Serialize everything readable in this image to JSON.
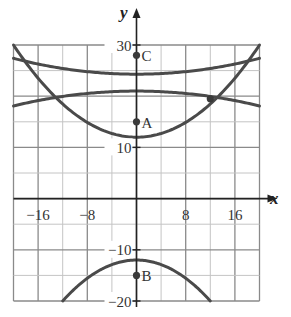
{
  "chart_data": {
    "type": "line",
    "title": "",
    "xlabel": "x",
    "ylabel": "y",
    "xlim": [
      -20,
      20
    ],
    "ylim": [
      -20,
      30
    ],
    "grid": true,
    "x_grid_step": 4,
    "y_grid_step": 5,
    "x_ticks": [
      {
        "value": -16,
        "label": "−16"
      },
      {
        "value": -8,
        "label": "−8"
      },
      {
        "value": 8,
        "label": "8"
      },
      {
        "value": 16,
        "label": "16"
      }
    ],
    "y_ticks": [
      {
        "value": 30,
        "label": "30"
      },
      {
        "value": 10,
        "label": "10"
      },
      {
        "value": -10,
        "label": "−10"
      },
      {
        "value": -20,
        "label": "−20"
      }
    ],
    "series": [
      {
        "name": "upward-parabola",
        "formula": "y = 12 + 0.045x^2",
        "x": [
          -20,
          -16,
          -12,
          -8,
          -4,
          0,
          4,
          8,
          12,
          16,
          20
        ],
        "y": [
          30,
          23.5,
          18.5,
          14.9,
          12.7,
          12,
          12.7,
          14.9,
          18.5,
          23.5,
          30
        ]
      },
      {
        "name": "upper-flat-curve",
        "formula": "y = 24.3 + 0.00775x^2",
        "x": [
          -20,
          -16,
          -12,
          -8,
          -4,
          0,
          4,
          8,
          12,
          16,
          20
        ],
        "y": [
          27.4,
          26.3,
          25.4,
          24.8,
          24.4,
          24.3,
          24.4,
          24.8,
          25.4,
          26.3,
          27.4
        ]
      },
      {
        "name": "lower-flat-curve",
        "formula": "y = 21 - 0.00725x^2",
        "x": [
          -20,
          -16,
          -12,
          -8,
          -4,
          0,
          4,
          8,
          12,
          16,
          20
        ],
        "y": [
          18.1,
          19.1,
          20.0,
          20.5,
          20.9,
          21,
          20.9,
          20.5,
          20.0,
          19.1,
          18.1
        ]
      },
      {
        "name": "downward-parabola",
        "formula": "y = -12 - x^2/18",
        "x": [
          -12,
          -8,
          -4,
          0,
          4,
          8,
          12
        ],
        "y": [
          -20,
          -15.6,
          -12.9,
          -12,
          -12.9,
          -15.6,
          -20
        ]
      }
    ],
    "points": [
      {
        "label": "C",
        "x": 0,
        "y": 28
      },
      {
        "label": "A",
        "x": 0,
        "y": 15
      },
      {
        "label": "B",
        "x": 0,
        "y": -15
      },
      {
        "label": "",
        "x": 12,
        "y": 19.5
      }
    ],
    "colors": {
      "curve": "#4a4a4a",
      "grid": "#9a9a9a",
      "axis": "#222222",
      "point": "#3a3a3a"
    }
  }
}
